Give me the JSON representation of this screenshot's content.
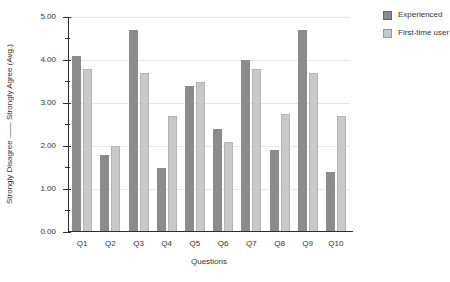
{
  "chart_data": {
    "type": "bar",
    "title": "",
    "xlabel": "Questions",
    "ylabel": "Strongly Disagree —— Strongly Agree  (Avg.)",
    "categories": [
      "Q1",
      "Q2",
      "Q3",
      "Q4",
      "Q5",
      "Q6",
      "Q7",
      "Q8",
      "Q9",
      "Q10"
    ],
    "series": [
      {
        "name": "Experienced",
        "color": "#8b8b8b",
        "values": [
          4.1,
          1.8,
          4.7,
          1.5,
          3.4,
          2.4,
          4.0,
          1.9,
          4.7,
          1.4
        ]
      },
      {
        "name": "First-time user",
        "color": "#c9c9c9",
        "values": [
          3.8,
          2.0,
          3.7,
          2.7,
          3.5,
          2.1,
          3.8,
          2.75,
          3.7,
          2.7
        ]
      }
    ],
    "ylim": [
      0,
      5
    ],
    "yticks": [
      "0.00",
      "1.00",
      "2.00",
      "3.00",
      "4.00",
      "5.00"
    ],
    "ytick_minor_step": 0.5,
    "grid": "horizontal-major",
    "legend_position": "top-right",
    "axis_color": "#2f2f2f",
    "grid_color": "#e7e7e7",
    "text_color": "#333333"
  }
}
